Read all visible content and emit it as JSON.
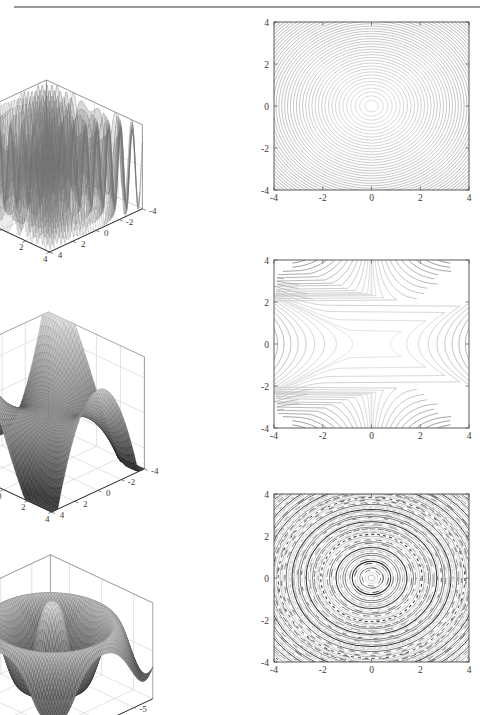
{
  "page": {
    "rule_label": "page-top-rule",
    "background": "#ffffff",
    "ink": "#3a3a3a"
  },
  "figure": {
    "rows": 3,
    "columns": 2,
    "column_kinds": [
      "surface3d",
      "contour"
    ]
  },
  "chart_data": [
    {
      "id": "surface-row1",
      "type": "surface3d",
      "title": "",
      "xlabel": "",
      "ylabel": "",
      "zlabel": "",
      "xlim": [
        -4,
        4
      ],
      "ylim": [
        -4,
        4
      ],
      "zlim": [
        -1,
        1
      ],
      "xticks": [
        -4,
        -2,
        0,
        2,
        4
      ],
      "yticks": [
        -4,
        -2,
        0,
        2,
        4
      ],
      "zticks": [
        -1,
        0,
        1
      ],
      "xtick_labels": [
        "-4",
        "-2",
        "0",
        "2",
        "4"
      ],
      "ytick_labels": [
        "4",
        "2",
        "0",
        "-2",
        "-4"
      ],
      "ztick_labels": [
        "1",
        "0",
        "-1"
      ],
      "grid": true,
      "legend": null,
      "surface_style": "wireframe-mesh",
      "colormap": "grayscale",
      "description": "highly oscillatory radial function, sin of large-frequency radius, values span -1 to 1",
      "function_hint": "z = sin(20*sqrt(x^2+y^2))",
      "mesh_n": 90,
      "freq": 9.0,
      "amp": 1.0,
      "kind": "ripple-high-frequency"
    },
    {
      "id": "contour-row1",
      "type": "contour",
      "title": "",
      "xlabel": "",
      "ylabel": "",
      "xlim": [
        -4,
        4
      ],
      "ylim": [
        -4,
        4
      ],
      "xticks": [
        -4,
        -2,
        0,
        2,
        4
      ],
      "yticks": [
        -4,
        -2,
        0,
        2,
        4
      ],
      "xtick_labels": [
        "-4",
        "-2",
        "0",
        "2",
        "4"
      ],
      "ytick_labels": [
        "-4",
        "-2",
        "0",
        "2",
        "4"
      ],
      "grid": false,
      "legend": null,
      "levels": 46,
      "description": "concentric near-circular contours centred at origin, spacing decreasing outward",
      "function_hint": "z = sin(20*sqrt(x^2+y^2)) level set family rendered as nested rings",
      "ring_count": 46,
      "center": [
        0,
        0
      ],
      "kind": "concentric-rings"
    },
    {
      "id": "surface-row2",
      "type": "surface3d",
      "title": "",
      "xlabel": "",
      "ylabel": "",
      "zlabel": "",
      "xlim": [
        -4,
        4
      ],
      "ylim": [
        -4,
        4
      ],
      "zlim": [
        -80,
        80
      ],
      "xticks": [
        -4,
        -2,
        0,
        2,
        4
      ],
      "yticks": [
        -4,
        -2,
        0,
        2,
        4
      ],
      "zticks": [
        -50,
        0,
        50
      ],
      "xtick_labels": [
        "-4",
        "-2",
        "0",
        "2",
        "4"
      ],
      "ytick_labels": [
        "4",
        "2",
        "0",
        "-2",
        "-4"
      ],
      "ztick_labels": [
        "50",
        "0",
        "-50"
      ],
      "grid": true,
      "legend": null,
      "surface_style": "smooth-shaded",
      "colormap": "grayscale",
      "description": "smooth monkey-saddle / cubic surface rising steeply at one corner",
      "function_hint": "z = x^3 - 3*x*y^2",
      "mesh_n": 44,
      "kind": "monkey-saddle"
    },
    {
      "id": "contour-row2",
      "type": "contour",
      "title": "",
      "xlabel": "",
      "ylabel": "",
      "xlim": [
        -4,
        4
      ],
      "ylim": [
        -4,
        4
      ],
      "xticks": [
        -4,
        -2,
        0,
        2,
        4
      ],
      "yticks": [
        -4,
        -2,
        0,
        2,
        4
      ],
      "xtick_labels": [
        "-4",
        "-2",
        "0",
        "2",
        "4"
      ],
      "ytick_labels": [
        "-4",
        "-2",
        "0",
        "2",
        "4"
      ],
      "grid": false,
      "legend": null,
      "levels": 26,
      "description": "S-shaped cubic level curves, open to the left and right, crowding at both vertical edges",
      "function_hint": "z = x^3 - 3*x*y^2",
      "kind": "cubic-saddle-contours"
    },
    {
      "id": "surface-row3",
      "type": "surface3d",
      "title": "",
      "xlabel": "",
      "ylabel": "",
      "zlabel": "",
      "xlim": [
        -8,
        8
      ],
      "ylim": [
        -8,
        8
      ],
      "zlim": [
        -1,
        1
      ],
      "xticks": [
        -5,
        0,
        5
      ],
      "yticks": [
        -5,
        0,
        5
      ],
      "zticks": [
        -1,
        0,
        1
      ],
      "xtick_labels": [
        "-5",
        "0",
        "5"
      ],
      "ytick_labels": [
        "5",
        "0",
        "-5"
      ],
      "ztick_labels": [
        "1",
        "0",
        "-1"
      ],
      "grid": true,
      "legend": null,
      "surface_style": "smooth-shaded-mesh",
      "colormap": "grayscale",
      "description": "sombrero / mexican-hat surface, central bowl surrounded by a raised ring and outer wave",
      "function_hint": "z = sin(sqrt(x^2+y^2)) type radial wave",
      "mesh_n": 64,
      "kind": "sombrero"
    },
    {
      "id": "contour-row3",
      "type": "contour",
      "title": "",
      "xlabel": "",
      "ylabel": "",
      "xlim": [
        -4,
        4
      ],
      "ylim": [
        -4,
        4
      ],
      "xticks": [
        -4,
        -2,
        0,
        2,
        4
      ],
      "yticks": [
        -4,
        -2,
        0,
        2,
        4
      ],
      "xtick_labels": [
        "-4",
        "-2",
        "0",
        "2",
        "4"
      ],
      "ytick_labels": [
        "-4",
        "-2",
        "0",
        "2",
        "4"
      ],
      "grid": false,
      "legend": null,
      "levels": 70,
      "description": "very dense concentric moire rings with fragmented broken arcs, alternating dark and light bands",
      "function_hint": "high frequency radial oscillation sampled near Nyquist limit",
      "ring_count": 70,
      "center": [
        0,
        0
      ],
      "kind": "moire-rings"
    }
  ]
}
